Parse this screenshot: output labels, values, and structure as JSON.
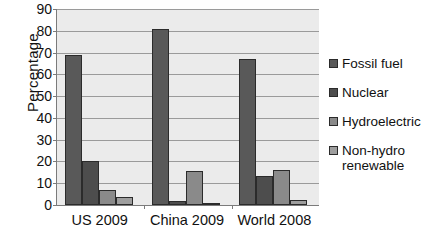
{
  "chart_data": {
    "type": "bar",
    "title": "",
    "xlabel": "",
    "ylabel": "Percentage",
    "ylim": [
      0,
      90
    ],
    "ytick_step": 10,
    "yticks": [
      "90",
      "80",
      "70",
      "60",
      "50",
      "40",
      "30",
      "20",
      "10",
      "0"
    ],
    "grid": true,
    "legend_position": "right",
    "categories": [
      "US 2009",
      "China 2009",
      "World 2008"
    ],
    "series": [
      {
        "name": "Fossil fuel",
        "values": [
          69,
          81,
          67
        ],
        "color": "#595959"
      },
      {
        "name": "Nuclear",
        "values": [
          20,
          2,
          13.5
        ],
        "color": "#4d4d4d"
      },
      {
        "name": "Hydroelectric",
        "values": [
          7,
          15.5,
          16
        ],
        "color": "#8a8a8a"
      },
      {
        "name": "Non-hydro renewable",
        "values": [
          3.5,
          0.7,
          2.5
        ],
        "color": "#9e9e9e"
      }
    ],
    "plot_background": "#ebebeb",
    "gridline_color": "#9a9a9a",
    "axis_color": "#7b7b7b"
  }
}
